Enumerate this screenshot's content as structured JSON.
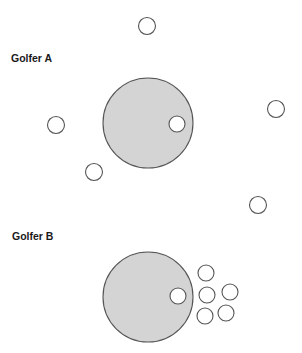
{
  "figure": {
    "width": 302,
    "height": 353,
    "colors": {
      "green_fill": "#d4d4d4",
      "stroke": "#555555",
      "ball_fill": "#ffffff",
      "label": "#1a1a1a"
    }
  },
  "panels": [
    {
      "label": "Golfer A",
      "label_pos": {
        "x": 11,
        "y": 52
      },
      "target": {
        "cx": 148,
        "cy": 123,
        "r": 45
      },
      "ball_in_target": {
        "cx": 177,
        "cy": 124,
        "r": 8
      },
      "shots": [
        {
          "cx": 147,
          "cy": 26,
          "r": 8.5
        },
        {
          "cx": 56,
          "cy": 125,
          "r": 8.5
        },
        {
          "cx": 276,
          "cy": 109,
          "r": 8.5
        },
        {
          "cx": 94,
          "cy": 172,
          "r": 8.5
        },
        {
          "cx": 258,
          "cy": 205,
          "r": 8.5
        }
      ]
    },
    {
      "label": "Golfer B",
      "label_pos": {
        "x": 12,
        "y": 230
      },
      "target": {
        "cx": 148,
        "cy": 297,
        "r": 45
      },
      "ball_in_target": {
        "cx": 178,
        "cy": 296,
        "r": 8
      },
      "shots": [
        {
          "cx": 206,
          "cy": 273,
          "r": 8
        },
        {
          "cx": 207,
          "cy": 295,
          "r": 8
        },
        {
          "cx": 230,
          "cy": 292,
          "r": 8
        },
        {
          "cx": 205,
          "cy": 316,
          "r": 8
        },
        {
          "cx": 226,
          "cy": 313,
          "r": 8
        }
      ]
    }
  ]
}
